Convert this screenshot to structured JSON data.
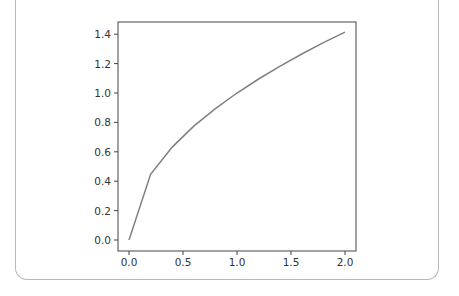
{
  "chart_data": {
    "type": "line",
    "title": "",
    "xlabel": "",
    "ylabel": "",
    "x": [
      0.0,
      0.2,
      0.4,
      0.6,
      0.8,
      1.0,
      1.2,
      1.4,
      1.6,
      1.8,
      2.0
    ],
    "series": [
      {
        "name": "y = sqrt(x)",
        "color": "#808080",
        "values": [
          0.0,
          0.447,
          0.632,
          0.775,
          0.894,
          1.0,
          1.095,
          1.183,
          1.265,
          1.342,
          1.414
        ]
      }
    ],
    "xticks": [
      "0.0",
      "0.5",
      "1.0",
      "1.5",
      "2.0"
    ],
    "yticks": [
      "0.0",
      "0.2",
      "0.4",
      "0.6",
      "0.8",
      "1.0",
      "1.2",
      "1.4"
    ],
    "xlim": [
      -0.1,
      2.1
    ],
    "ylim": [
      -0.07,
      1.48
    ],
    "grid": false,
    "legend": null
  }
}
